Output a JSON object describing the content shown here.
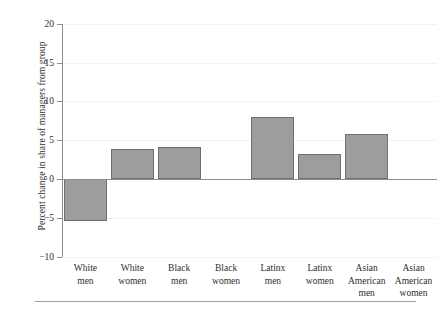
{
  "chart_data": {
    "type": "bar",
    "title": "",
    "xlabel": "",
    "ylabel": "Percent change in share of managers from group",
    "ylim": [
      -10,
      20
    ],
    "ytick_labels": [
      "20",
      "15",
      "10",
      "5",
      "0",
      "−5",
      "−10"
    ],
    "ytick_values": [
      20,
      15,
      10,
      5,
      0,
      -5,
      -10
    ],
    "grid": true,
    "legend": "none",
    "categories": [
      "White men",
      "White women",
      "Black men",
      "Black women",
      "Latinx men",
      "Latinx women",
      "Asian American men",
      "Asian American women"
    ],
    "category_lines": [
      [
        "White",
        "men"
      ],
      [
        "White",
        "women"
      ],
      [
        "Black",
        "men"
      ],
      [
        "Black",
        "women"
      ],
      [
        "Latinx",
        "men"
      ],
      [
        "Latinx",
        "women"
      ],
      [
        "Asian",
        "American",
        "men"
      ],
      [
        "Asian",
        "American",
        "women"
      ]
    ],
    "values": [
      -5.4,
      3.9,
      4.2,
      0.0,
      8.0,
      3.3,
      5.9,
      0.0
    ],
    "bar_color": "#9d9d9d",
    "bar_edge_color": "#6f6f6f",
    "axis_color": "#8d8d8d",
    "gridline_color": "#f2f2f2",
    "background": "#ffffff"
  }
}
